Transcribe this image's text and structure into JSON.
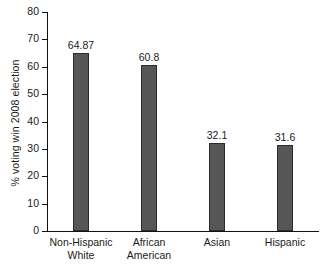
{
  "chart_data": {
    "type": "bar",
    "title": "",
    "subtitle": "",
    "xlabel": "",
    "ylabel": "% voting win 2008 election",
    "categories": [
      "Non-Hispanic White",
      "African American",
      "Asian",
      "Hispanic"
    ],
    "category_lines": [
      [
        "Non-Hispanic",
        "White"
      ],
      [
        "African",
        "American"
      ],
      [
        "Asian",
        ""
      ],
      [
        "Hispanic",
        ""
      ]
    ],
    "values": [
      64.87,
      60.8,
      32.1,
      31.6
    ],
    "value_labels": [
      "64.87",
      "60.8",
      "32.1",
      "31.6"
    ],
    "ylim": [
      0,
      80
    ],
    "ytick_step": 10,
    "ytick_labels": [
      "0",
      "10",
      "20",
      "30",
      "40",
      "50",
      "60",
      "70",
      "80"
    ],
    "grid": false,
    "legend": false,
    "legend_position": "none",
    "bar_color": "#565656",
    "bar_edge_color": "#2b2b2b",
    "axis_color": "#111111",
    "text_color": "#1a1a1a",
    "background_color": "#ffffff"
  }
}
